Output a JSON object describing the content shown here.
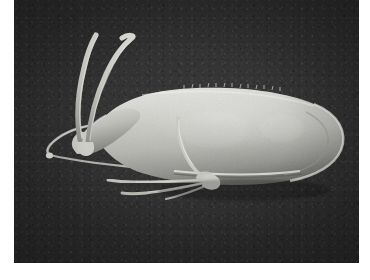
{
  "image": {
    "kind": "scanning-electron-micrograph",
    "subject": "flagellated protozoan cell",
    "caption_text": "",
    "orientation": "anterior left, posterior right",
    "plate": {
      "left": 14,
      "top": 0,
      "width": 345,
      "height": 263,
      "border_color": "#ffffff",
      "background_color": "#343434"
    },
    "colors": {
      "background_dark": "#343434",
      "background_deep": "#2c2c2c",
      "specimen_light": "#d8d8d4",
      "specimen_mid": "#b0b0ab",
      "specimen_shadow": "#6e6e6a",
      "flagella_light": "#cfcfca",
      "border_white": "#ffffff"
    },
    "features": [
      {
        "id": "cell-body",
        "label": "cell body",
        "description": "elongate pear-shaped body tapering to the left"
      },
      {
        "id": "anterior-flagella-pair",
        "label": "anterior flagella pair",
        "description": "two flagella arching upward from the anterior tip"
      },
      {
        "id": "lateral-flagellum",
        "label": "lateral flagellum",
        "description": "long flagellum sweeping left and ending in a small knob"
      },
      {
        "id": "ventral-flagella-bundle",
        "label": "ventral flagella bundle",
        "description": "two to three flagella projecting ventro-laterally"
      },
      {
        "id": "caudal-flagellum",
        "label": "caudal flagellum",
        "description": "short flagellum running down across the ventral surface"
      },
      {
        "id": "ventral-ridge",
        "label": "ventral ridge",
        "description": "longitudinal ridge along the lower margin of the body"
      },
      {
        "id": "dorsal-bristles",
        "label": "dorsal surface bristles",
        "description": "fine projections along the upper body margin"
      },
      {
        "id": "posterior-end",
        "label": "posterior end",
        "description": "broadly rounded posterior pole"
      }
    ]
  }
}
